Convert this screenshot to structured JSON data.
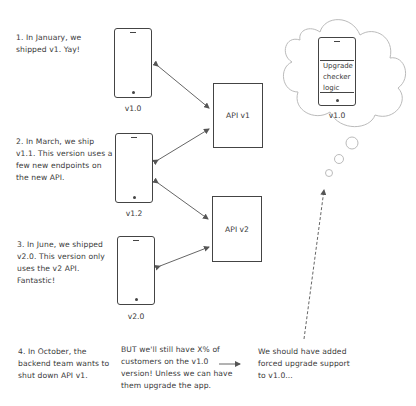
{
  "steps": [
    {
      "text": "1. In January, we\nshipped v1. Yay!"
    },
    {
      "text": "2. In March, we ship\nv1.1. This version uses a\nfew new endpoints on\nthe new API."
    },
    {
      "text": "3. In June, we shipped\nv2.0. This version only\nuses the v2 API.\nFantastic!"
    },
    {
      "text": "4. In October, the\nbackend team wants to\nshut down API v1."
    }
  ],
  "phones": [
    {
      "label": "v1.0"
    },
    {
      "label": "v1.2"
    },
    {
      "label": "v2.0"
    }
  ],
  "apis": [
    {
      "label": "API v1"
    },
    {
      "label": "API v2"
    }
  ],
  "thought": {
    "screen_text": "Upgrade\nchecker\nlogic",
    "label": "v1.0"
  },
  "consequence": "BUT we'll still have X% of\ncustomers on the v1.0\nversion! Unless we can have\nthem upgrade the app.",
  "conclusion": "We should have added\nforced upgrade support\nto v1.0...",
  "colors": {
    "line": "#444444",
    "arrow": "#666666",
    "cloud": "#bbbbbb"
  }
}
